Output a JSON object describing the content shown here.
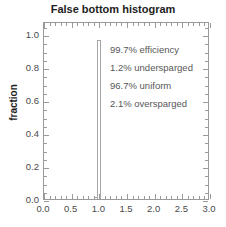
{
  "chart_data": {
    "type": "bar",
    "title": "False bottom histogram",
    "xlabel": "",
    "ylabel": "fraction",
    "xlim": [
      0.0,
      3.0
    ],
    "ylim": [
      0.0,
      1.08
    ],
    "grid": false,
    "legend_position": "none",
    "xticks": [
      "0.0",
      "0.5",
      "1.0",
      "1.5",
      "2.0",
      "2.5",
      "3.0"
    ],
    "xtick_values": [
      0.0,
      0.5,
      1.0,
      1.5,
      2.0,
      2.5,
      3.0
    ],
    "yticks": [
      "0.0",
      "0.2",
      "0.4",
      "0.6",
      "0.8",
      "1.0"
    ],
    "ytick_values": [
      0.0,
      0.2,
      0.4,
      0.6,
      0.8,
      1.0
    ],
    "x": [
      0.94,
      1.0
    ],
    "values": [
      0.012,
      0.967
    ],
    "bar_width": 0.07,
    "bar_fill": "#ffffff",
    "bar_edge_color": "#a6a6a6",
    "annotations": [
      "99.7% efficiency",
      "1.2% undersparged",
      "96.7% uniform",
      "2.1% oversparged"
    ],
    "annotation_color": "#575757",
    "axis_color": "#9a9a9a",
    "title_color": "#1d1d1d"
  }
}
